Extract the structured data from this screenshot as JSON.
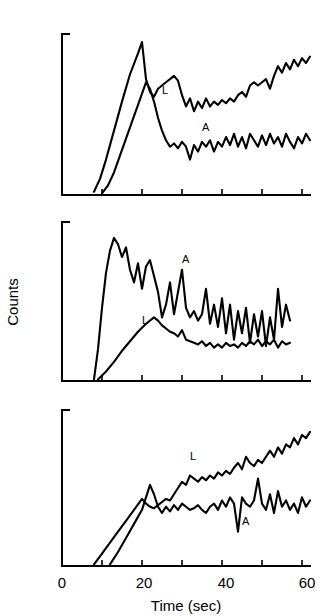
{
  "figure": {
    "xlabel": "Time (sec)",
    "ylabel": "Counts",
    "xticklabels": [
      "0",
      "20",
      "40",
      "60"
    ],
    "xtickvalues": [
      0,
      20,
      40,
      60
    ],
    "xminorticks": [
      10,
      30,
      50
    ],
    "panels": [
      "top",
      "middle",
      "bottom"
    ]
  },
  "labels": {
    "L": "L",
    "A": "A",
    "x0": "0",
    "x20": "20",
    "x40": "40",
    "x60": "60",
    "xaxis": "Time (sec)",
    "yaxis": "Counts"
  },
  "chart_data": [
    {
      "type": "line",
      "title": "",
      "panel": "top",
      "xlabel": "",
      "ylabel": "Counts",
      "xlim": [
        0,
        62
      ],
      "ylim": [
        0,
        100
      ],
      "grid": false,
      "legend_position": "inline-annotation",
      "series": [
        {
          "name": "L",
          "label_x": 25,
          "label_y": 63,
          "x": [
            8,
            9.5,
            11,
            13,
            15,
            17,
            19,
            20,
            21,
            22,
            23,
            24,
            25,
            26,
            27,
            28,
            29,
            30,
            31,
            32,
            33,
            34,
            35,
            36,
            37,
            38,
            39,
            40,
            41,
            42,
            43,
            44,
            45,
            46,
            47,
            48,
            49,
            50,
            51,
            52,
            53,
            54,
            55,
            56,
            57,
            58,
            59,
            60,
            61,
            62
          ],
          "y": [
            2,
            10,
            22,
            40,
            58,
            75,
            88,
            95,
            72,
            64,
            61,
            66,
            68,
            70,
            72,
            74,
            71,
            62,
            55,
            60,
            52,
            58,
            54,
            60,
            55,
            58,
            56,
            59,
            57,
            60,
            58,
            62,
            64,
            61,
            68,
            70,
            68,
            70,
            72,
            66,
            74,
            80,
            76,
            82,
            78,
            84,
            80,
            85,
            82,
            86
          ]
        },
        {
          "name": "A",
          "label_x": 35,
          "label_y": 40,
          "x": [
            10,
            11.5,
            13,
            15,
            17,
            19,
            21,
            22,
            23,
            24,
            25,
            26,
            27,
            28,
            29,
            30,
            31,
            32,
            33,
            34,
            35,
            36,
            37,
            38,
            39,
            40,
            41,
            42,
            43,
            44,
            45,
            46,
            47,
            48,
            49,
            50,
            51,
            52,
            53,
            54,
            55,
            56,
            57,
            58,
            59,
            60,
            61,
            62
          ],
          "y": [
            1,
            6,
            14,
            28,
            42,
            56,
            70,
            66,
            58,
            48,
            40,
            34,
            30,
            32,
            29,
            33,
            30,
            22,
            31,
            27,
            33,
            30,
            34,
            27,
            33,
            30,
            36,
            31,
            38,
            30,
            36,
            29,
            38,
            34,
            30,
            37,
            31,
            38,
            32,
            36,
            30,
            38,
            33,
            29,
            36,
            32,
            38,
            34
          ]
        }
      ]
    },
    {
      "type": "line",
      "title": "",
      "panel": "middle",
      "xlabel": "",
      "ylabel": "Counts",
      "xlim": [
        0,
        62
      ],
      "ylim": [
        0,
        100
      ],
      "grid": false,
      "legend_position": "inline-annotation",
      "series": [
        {
          "name": "A",
          "label_x": 30,
          "label_y": 74,
          "x": [
            8,
            9,
            10,
            11,
            12,
            13,
            14,
            15,
            16,
            17,
            18,
            19,
            20,
            21,
            22,
            23,
            24,
            25,
            26,
            27,
            28,
            29,
            30,
            31,
            32,
            33,
            34,
            35,
            36,
            37,
            38,
            39,
            40,
            41,
            42,
            43,
            44,
            45,
            46,
            47,
            48,
            49,
            50,
            51,
            52,
            53,
            54,
            55,
            56,
            57
          ],
          "y": [
            1,
            20,
            46,
            68,
            82,
            90,
            86,
            78,
            84,
            70,
            62,
            74,
            58,
            72,
            76,
            66,
            56,
            40,
            48,
            62,
            42,
            56,
            70,
            46,
            40,
            44,
            38,
            42,
            58,
            36,
            48,
            34,
            52,
            30,
            48,
            26,
            44,
            30,
            46,
            24,
            42,
            28,
            44,
            22,
            40,
            26,
            58,
            34,
            48,
            38
          ]
        },
        {
          "name": "L",
          "label_x": 20,
          "label_y": 36,
          "x": [
            9,
            11,
            13,
            15,
            17,
            19,
            21,
            23,
            24,
            25,
            26,
            27,
            28,
            29,
            30,
            31,
            32,
            33,
            34,
            35,
            36,
            37,
            38,
            39,
            40,
            41,
            42,
            43,
            44,
            45,
            46,
            47,
            48,
            49,
            50,
            51,
            52,
            53,
            54,
            55,
            56,
            57
          ],
          "y": [
            1,
            6,
            12,
            19,
            25,
            31,
            36,
            40,
            38,
            35,
            33,
            31,
            30,
            28,
            32,
            26,
            25,
            24,
            23,
            25,
            22,
            24,
            21,
            23,
            21,
            24,
            22,
            23,
            21,
            24,
            22,
            25,
            23,
            26,
            22,
            25,
            23,
            26,
            21,
            25,
            23,
            24
          ]
        }
      ]
    },
    {
      "type": "line",
      "title": "",
      "panel": "bottom",
      "xlabel": "Time (sec)",
      "ylabel": "Counts",
      "xlim": [
        0,
        62
      ],
      "ylim": [
        0,
        100
      ],
      "grid": false,
      "legend_position": "inline-annotation",
      "series": [
        {
          "name": "L",
          "label_x": 32,
          "label_y": 68,
          "x": [
            8,
            10,
            12,
            14,
            16,
            18,
            20,
            21,
            22,
            23,
            24,
            25,
            26,
            27,
            28,
            29,
            30,
            31,
            32,
            33,
            34,
            35,
            36,
            37,
            38,
            39,
            40,
            41,
            42,
            43,
            44,
            45,
            46,
            47,
            48,
            49,
            50,
            51,
            52,
            53,
            54,
            55,
            56,
            57,
            58,
            59,
            60,
            61,
            62
          ],
          "y": [
            1,
            8,
            15,
            22,
            29,
            36,
            43,
            40,
            38,
            37,
            39,
            41,
            43,
            42,
            46,
            50,
            54,
            52,
            58,
            56,
            54,
            57,
            55,
            58,
            56,
            60,
            58,
            61,
            59,
            63,
            66,
            62,
            70,
            66,
            64,
            68,
            66,
            70,
            74,
            70,
            76,
            72,
            78,
            76,
            82,
            78,
            84,
            82,
            86
          ]
        },
        {
          "name": "A",
          "label_x": 45,
          "label_y": 26,
          "x": [
            12,
            14,
            16,
            18,
            20,
            21,
            22,
            23,
            24,
            25,
            26,
            27,
            28,
            29,
            30,
            31,
            32,
            33,
            34,
            35,
            36,
            37,
            38,
            39,
            40,
            41,
            42,
            43,
            44,
            45,
            46,
            47,
            48,
            49,
            50,
            51,
            52,
            53,
            54,
            55,
            56,
            57,
            58,
            59,
            60,
            61,
            62
          ],
          "y": [
            1,
            9,
            18,
            27,
            36,
            44,
            52,
            46,
            38,
            34,
            38,
            35,
            39,
            36,
            40,
            38,
            36,
            37,
            39,
            36,
            34,
            38,
            40,
            36,
            42,
            38,
            44,
            40,
            22,
            44,
            40,
            38,
            42,
            56,
            40,
            36,
            46,
            34,
            48,
            38,
            42,
            36,
            40,
            34,
            44,
            38,
            42
          ]
        }
      ]
    }
  ]
}
